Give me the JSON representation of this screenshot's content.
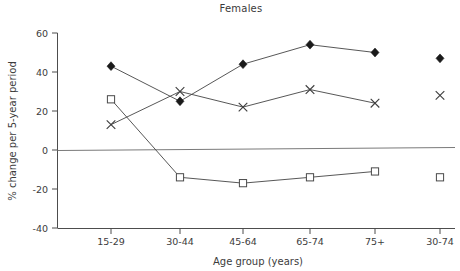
{
  "chart_data": {
    "type": "line",
    "title": "Females",
    "xlabel": "Age group (years)",
    "ylabel": "% change per 5-year period",
    "categories": [
      "15-29",
      "30-44",
      "45-64",
      "65-74",
      "75+",
      "30-74"
    ],
    "ylim": [
      -40,
      60
    ],
    "yticks": [
      -40,
      -20,
      0,
      20,
      40,
      60
    ],
    "yticklabels": [
      "-40",
      "-20",
      "0",
      "20",
      "40",
      "60"
    ],
    "grid": false,
    "legend": "none",
    "zero_reference_line": true,
    "last_category_detached": true,
    "series": [
      {
        "name": "diamond-series",
        "marker": "diamond",
        "values": [
          43,
          25,
          44,
          54,
          50,
          47
        ],
        "connected": [
          true,
          true,
          true,
          true,
          true,
          false
        ]
      },
      {
        "name": "cross-series",
        "marker": "cross",
        "values": [
          13,
          30,
          22,
          31,
          24,
          28
        ],
        "connected": [
          true,
          true,
          true,
          true,
          true,
          false
        ]
      },
      {
        "name": "square-series",
        "marker": "square",
        "values": [
          26,
          -14,
          -17,
          -14,
          -11,
          -14
        ],
        "connected": [
          true,
          true,
          true,
          true,
          true,
          false
        ]
      }
    ]
  },
  "axis": {
    "y_title": "% change per 5-year period",
    "x_title": "Age group (years)",
    "y_labels": [
      "60",
      "40",
      "20",
      "0",
      "-20",
      "-40"
    ],
    "x_labels": [
      "15-29",
      "30-44",
      "45-64",
      "65-74",
      "75+",
      "30-74"
    ]
  },
  "header": {
    "title": "Females"
  },
  "colors": {
    "axis": "#4d4d4d",
    "zero_line": "#7a7a7a",
    "line": "#444444",
    "diamond_fill": "#1a1a1a",
    "square_fill": "#ffffff",
    "square_stroke": "#4a4a4a",
    "cross_stroke": "#3d3d3d",
    "text": "#3c3c3c",
    "background": "#ffffff"
  }
}
